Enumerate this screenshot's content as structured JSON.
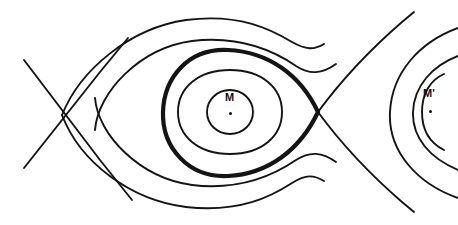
{
  "figure": {
    "name": "gravitational-equipotential-contour-diagram",
    "background_color": "#ffffff",
    "stroke_color": "#141414",
    "width": 458,
    "height": 225
  },
  "labels": {
    "primary_mass": {
      "text": "M",
      "x": 230,
      "y": 98,
      "dot_x": 230,
      "dot_y": 113
    },
    "secondary_mass": {
      "text": "M'",
      "x": 427,
      "y": 94,
      "dot_x": 430,
      "dot_y": 111
    }
  },
  "chart_data": {
    "type": "line",
    "title": "",
    "xlabel": "",
    "ylabel": "",
    "grid": false,
    "legend": "none",
    "xlim": [
      0,
      458
    ],
    "ylim": [
      0,
      225
    ],
    "saddle_points": [
      {
        "name": "left-crossing",
        "x": 62,
        "y": 115
      },
      {
        "name": "right-crossing",
        "x": 318,
        "y": 112
      }
    ],
    "series": [
      {
        "name": "asymptote-upper-left",
        "style": "thin",
        "path": "M 24,60 L 100,160 L 132,200"
      },
      {
        "name": "asymptote-lower-left",
        "style": "thin",
        "path": "M 24,168 L 100,72 L 128,38"
      },
      {
        "name": "outer-contour-upper",
        "style": "thin",
        "path": "M 62,115 C 80,70 130,28 186,20 C 240,13 272,30 292,42 C 306,50 314,50 324,44"
      },
      {
        "name": "outer-contour-lower",
        "style": "thin",
        "path": "M 62,115 C 80,162 130,200 186,207 C 240,213 272,196 292,183 C 306,174 314,175 324,181"
      },
      {
        "name": "second-contour-upper",
        "style": "thin",
        "path": "M 95,130 C 98,92 140,48 192,41 C 243,35 277,53 296,66 C 310,75 322,74 336,64"
      },
      {
        "name": "second-contour-lower",
        "style": "thin",
        "path": "M 95,98 C 98,135 140,178 192,185 C 243,191 277,173 296,160 C 310,151 322,152 336,162"
      },
      {
        "name": "separatrix-closed-thick",
        "style": "thick",
        "path": "M 318,112 C 300,74 268,52 228,50 C 188,48 164,78 163,112 C 162,147 188,178 228,176 C 268,174 300,150 318,112 Z"
      },
      {
        "name": "inner-oval",
        "style": "thin",
        "path": "M 230,70 C 262,70 282,88 282,112 C 282,136 262,154 230,154 C 198,154 178,136 178,112 C 178,88 198,70 230,70 Z"
      },
      {
        "name": "innermost-circle",
        "style": "thin",
        "path": "M 230,90 C 243,90 253,100 253,112 C 253,124 243,134 230,134 C 217,134 207,124 207,112 C 207,100 217,90 230,90 Z"
      },
      {
        "name": "right-asymptote-upper",
        "style": "thin",
        "path": "M 318,112 C 340,82 372,48 402,22 L 414,12"
      },
      {
        "name": "right-asymptote-lower",
        "style": "thin",
        "path": "M 318,112 C 340,142 372,176 402,202 L 414,212"
      },
      {
        "name": "right-outer-arc",
        "style": "thin",
        "path": "M 458,28 C 420,42 392,72 390,112 C 388,152 418,184 458,198"
      },
      {
        "name": "right-middle-arc",
        "style": "thin",
        "path": "M 458,56 C 432,66 414,86 413,112 C 412,138 430,158 458,170"
      },
      {
        "name": "right-inner-arc",
        "style": "thin",
        "path": "M 444,74 C 430,80 422,94 422,112 C 422,130 430,143 444,150"
      }
    ]
  }
}
